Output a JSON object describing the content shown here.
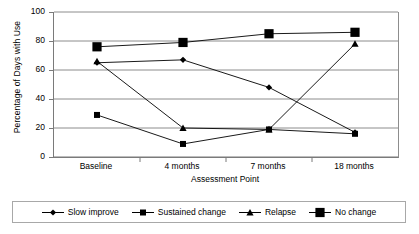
{
  "chart_data": {
    "type": "line",
    "title": "",
    "xlabel": "Assessment Point",
    "ylabel": "Percentage of  Days with Use",
    "categories": [
      "Baseline",
      "4 months",
      "7 months",
      "18 months"
    ],
    "ylim": [
      0,
      100
    ],
    "yticks": [
      0,
      20,
      40,
      60,
      80,
      100
    ],
    "grid": "horizontal",
    "legend_position": "bottom",
    "series": [
      {
        "name": "Slow improve",
        "marker": "diamond",
        "values": [
          65,
          67,
          48,
          17
        ]
      },
      {
        "name": "Sustained change",
        "marker": "square-small",
        "values": [
          29,
          9,
          19,
          16
        ]
      },
      {
        "name": "Relapse",
        "marker": "triangle",
        "values": [
          66,
          20,
          19,
          78
        ]
      },
      {
        "name": "No change",
        "marker": "square-large",
        "values": [
          76,
          79,
          85,
          86
        ]
      }
    ],
    "colors": {
      "line": "#000000",
      "marker": "#000000",
      "grid": "#808080",
      "axis": "#7a7a7a",
      "background": "#ffffff"
    }
  },
  "axis": {
    "y_tick_labels": [
      "100",
      "80",
      "60",
      "40",
      "20",
      "0"
    ],
    "x_tick_labels": [
      "Baseline",
      "4 months",
      "7 months",
      "18 months"
    ],
    "y_title": "Percentage of  Days with Use",
    "x_title": "Assessment Point"
  },
  "legend": {
    "items": [
      {
        "label": "Slow improve"
      },
      {
        "label": "Sustained change"
      },
      {
        "label": "Relapse"
      },
      {
        "label": "No change"
      }
    ]
  }
}
